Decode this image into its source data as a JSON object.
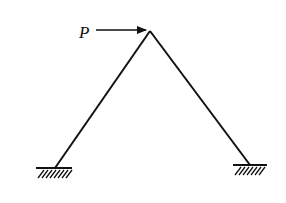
{
  "diagram": {
    "type": "structural-frame",
    "load": {
      "label": "P",
      "direction": "right",
      "applied_at": "apex"
    },
    "supports": [
      {
        "name": "left",
        "type": "fixed"
      },
      {
        "name": "right",
        "type": "fixed"
      }
    ],
    "colors": {
      "stroke": "#111111",
      "background": "#ffffff"
    }
  }
}
